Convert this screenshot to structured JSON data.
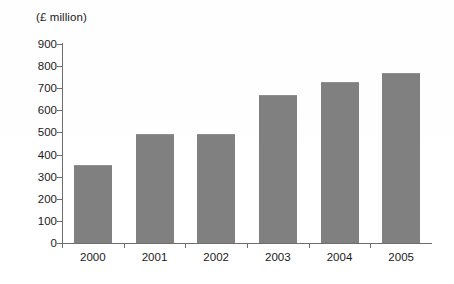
{
  "chart_data": {
    "type": "bar",
    "title": "(£ million)",
    "unit_caption": "(£ million)",
    "xlabel": "",
    "ylabel": "",
    "ylim": [
      0,
      900
    ],
    "ytick_step": 100,
    "grid": false,
    "legend": false,
    "bar_color": "#808080",
    "axis_color": "#6e6e6e",
    "text_color": "#1a1a1a",
    "categories": [
      "2000",
      "2001",
      "2002",
      "2003",
      "2004",
      "2005"
    ],
    "values": [
      350,
      490,
      490,
      665,
      725,
      765
    ],
    "ytick_labels": [
      "900",
      "800",
      "700",
      "600",
      "500",
      "400",
      "300",
      "200",
      "100",
      "0"
    ],
    "ytick_values": [
      900,
      800,
      700,
      600,
      500,
      400,
      300,
      200,
      100,
      0
    ],
    "series": [
      {
        "name": "Value",
        "values": [
          350,
          490,
          490,
          665,
          725,
          765
        ]
      }
    ]
  }
}
